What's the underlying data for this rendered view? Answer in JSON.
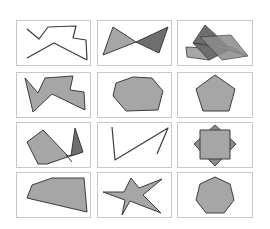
{
  "figure": {
    "title": "Polygon classification grid",
    "frame_color": "#c8c8c8",
    "fill_light": "#a6a6a6",
    "fill_dark": "#6e6e6e",
    "fill_mid": "#8c8c8c",
    "stroke": "#3c3c3c",
    "cells": [
      {
        "id": "r1c1",
        "label": "open zigzag polylines",
        "box": [
          16,
          20,
          74,
          45
        ]
      },
      {
        "id": "r1c2",
        "label": "bowtie triangles",
        "box": [
          97,
          20,
          74,
          45
        ]
      },
      {
        "id": "r1c3",
        "label": "overlapping parallelograms",
        "box": [
          177,
          20,
          75,
          45
        ]
      },
      {
        "id": "r2c1",
        "label": "concave irregular polygon",
        "box": [
          16,
          72,
          74,
          45
        ]
      },
      {
        "id": "r2c2",
        "label": "irregular heptagon",
        "box": [
          97,
          72,
          74,
          45
        ]
      },
      {
        "id": "r2c3",
        "label": "regular pentagon",
        "box": [
          177,
          72,
          75,
          45
        ]
      },
      {
        "id": "r3c1",
        "label": "quadrilateral with triangle",
        "box": [
          16,
          122,
          74,
          45
        ]
      },
      {
        "id": "r3c2",
        "label": "open polyline",
        "box": [
          97,
          122,
          74,
          45
        ]
      },
      {
        "id": "r3c3",
        "label": "square over diamond",
        "box": [
          177,
          122,
          75,
          45
        ]
      },
      {
        "id": "r4c1",
        "label": "irregular pentagon",
        "box": [
          16,
          172,
          74,
          45
        ]
      },
      {
        "id": "r4c2",
        "label": "irregular star",
        "box": [
          97,
          172,
          74,
          45
        ]
      },
      {
        "id": "r4c3",
        "label": "regular heptagon",
        "box": [
          177,
          172,
          75,
          45
        ]
      }
    ]
  }
}
